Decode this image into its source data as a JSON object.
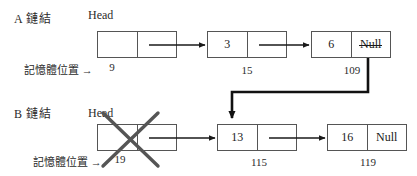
{
  "diagram": {
    "title_visible": false,
    "colors": {
      "ink": "#1a1a1a",
      "box_border": "#555555",
      "thick_link": "#111111",
      "cross_out": "#555555"
    },
    "rows": [
      {
        "id": "A",
        "row_label": "A 鏈結",
        "head_label": "Head",
        "memory_label": "記憶體位置 →",
        "nodes": [
          {
            "data": "",
            "pointer": "",
            "address": "9",
            "pointer_struck": false,
            "crossed_out": false
          },
          {
            "data": "3",
            "pointer": "",
            "address": "15",
            "pointer_struck": false,
            "crossed_out": false
          },
          {
            "data": "6",
            "pointer": "Null",
            "address": "109",
            "pointer_struck": true,
            "crossed_out": false
          }
        ]
      },
      {
        "id": "B",
        "row_label": "B 鏈結",
        "head_label": "Head",
        "memory_label": "記憶體位置 →",
        "nodes": [
          {
            "data": "",
            "pointer": "",
            "address": "19",
            "pointer_struck": false,
            "crossed_out": true
          },
          {
            "data": "13",
            "pointer": "",
            "address": "115",
            "pointer_struck": false,
            "crossed_out": false
          },
          {
            "data": "16",
            "pointer": "Null",
            "address": "119",
            "pointer_struck": false,
            "crossed_out": false
          }
        ]
      }
    ],
    "annotations": {
      "redirect_note": "6 節點的 Null 指標改指向 13 節點",
      "deleted_note": "B 鏈結的 Head 節點被刪除"
    }
  }
}
